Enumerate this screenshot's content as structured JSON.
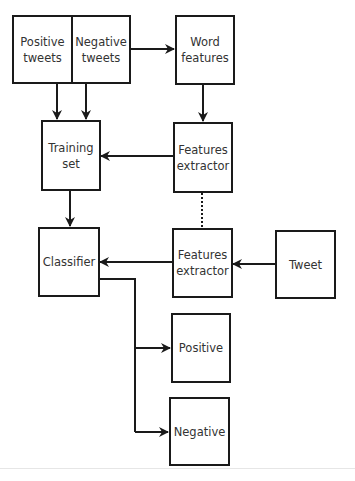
{
  "diagram": {
    "type": "flowchart",
    "title": "",
    "nodes": [
      {
        "id": "positive_tweets",
        "label": "Positive\ntweets"
      },
      {
        "id": "negative_tweets",
        "label": "Negative\ntweets"
      },
      {
        "id": "word_features",
        "label": "Word\nfeatures"
      },
      {
        "id": "training_set",
        "label": "Training\nset"
      },
      {
        "id": "features_extractor_1",
        "label": "Features\nextractor"
      },
      {
        "id": "classifier",
        "label": "Classifier"
      },
      {
        "id": "features_extractor_2",
        "label": "Features\nextractor"
      },
      {
        "id": "tweet",
        "label": "Tweet"
      },
      {
        "id": "positive",
        "label": "Positive"
      },
      {
        "id": "negative",
        "label": "Negative"
      }
    ],
    "edges": [
      {
        "from": "negative_tweets",
        "to": "word_features",
        "style": "solid-arrow"
      },
      {
        "from": "positive_tweets",
        "to": "training_set",
        "style": "solid-arrow"
      },
      {
        "from": "negative_tweets",
        "to": "training_set",
        "style": "solid-arrow"
      },
      {
        "from": "word_features",
        "to": "features_extractor_1",
        "style": "solid-arrow"
      },
      {
        "from": "features_extractor_1",
        "to": "training_set",
        "style": "solid-arrow"
      },
      {
        "from": "training_set",
        "to": "classifier",
        "style": "solid-arrow"
      },
      {
        "from": "features_extractor_1",
        "to": "features_extractor_2",
        "style": "dotted-line"
      },
      {
        "from": "tweet",
        "to": "features_extractor_2",
        "style": "solid-arrow"
      },
      {
        "from": "features_extractor_2",
        "to": "classifier",
        "style": "solid-arrow"
      },
      {
        "from": "classifier",
        "to": "positive",
        "style": "solid-arrow"
      },
      {
        "from": "classifier",
        "to": "negative",
        "style": "solid-arrow"
      }
    ],
    "colors": {
      "stroke": "#1a1a1a",
      "text": "#333333",
      "background": "#ffffff"
    }
  },
  "labels": {
    "positive_tweets": "Positive\ntweets",
    "negative_tweets": "Negative\ntweets",
    "word_features": "Word\nfeatures",
    "training_set": "Training\nset",
    "features_extractor_1": "Features\nextractor",
    "classifier": "Classifier",
    "features_extractor_2": "Features\nextractor",
    "tweet": "Tweet",
    "positive": "Positive",
    "negative": "Negative"
  }
}
